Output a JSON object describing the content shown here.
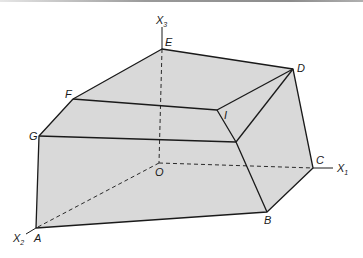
{
  "diagram": {
    "type": "3d-polyhedron",
    "fill_color": "#d9d9d9",
    "edge_color": "#1a1a1a",
    "axes": [
      {
        "name": "X1",
        "label": "X",
        "sub": "1"
      },
      {
        "name": "X2",
        "label": "X",
        "sub": "2"
      },
      {
        "name": "X3",
        "label": "X",
        "sub": "3"
      }
    ],
    "vertices": {
      "A": "A",
      "B": "B",
      "C": "C",
      "D": "D",
      "E": "E",
      "F": "F",
      "G": "G",
      "I": "I",
      "O": "O"
    }
  }
}
